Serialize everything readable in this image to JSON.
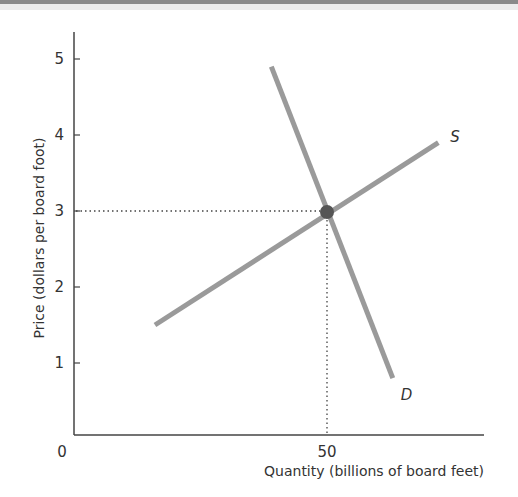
{
  "chart_data": {
    "type": "line",
    "title": "",
    "xlabel": "Quantity (billions of board feet)",
    "ylabel": "Price (dollars per board foot)",
    "xlim": [
      0,
      81
    ],
    "ylim": [
      0,
      5.3
    ],
    "x_ticks": [
      {
        "value": 0,
        "label": "0"
      },
      {
        "value": 50,
        "label": "50"
      }
    ],
    "y_ticks": [
      {
        "value": 1,
        "label": "1"
      },
      {
        "value": 2,
        "label": "2"
      },
      {
        "value": 3,
        "label": "3"
      },
      {
        "value": 4,
        "label": "4"
      },
      {
        "value": 5,
        "label": "5"
      }
    ],
    "grid": false,
    "legend": "none (curves labeled directly)",
    "series": [
      {
        "name": "S",
        "label": "S",
        "description": "Supply",
        "x": [
          16,
          72
        ],
        "y": [
          1.5,
          3.9
        ],
        "color": "#9a9a9a"
      },
      {
        "name": "D",
        "label": "D",
        "description": "Demand",
        "x": [
          39,
          63
        ],
        "y": [
          4.9,
          0.8
        ],
        "color": "#9a9a9a"
      }
    ],
    "equilibrium": {
      "x": 50,
      "y": 3,
      "color": "#555555"
    },
    "guides": [
      {
        "type": "horizontal-dotted",
        "y": 3,
        "from_x": 0,
        "to_x": 50
      },
      {
        "type": "vertical-dotted",
        "x": 50,
        "from_y": 0,
        "to_y": 3
      }
    ]
  },
  "colors": {
    "axis": "#444444",
    "curve": "#9a9a9a",
    "equilibrium_dot": "#555555",
    "text": "#333333"
  }
}
